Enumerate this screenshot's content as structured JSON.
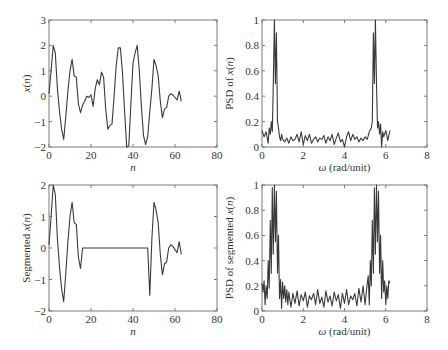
{
  "figure": {
    "background": "#ffffff",
    "line_color": "#3a3a3a",
    "frame_color": "#7a7a7a"
  },
  "chart_data": [
    {
      "id": "signal",
      "type": "line",
      "title": "",
      "xlabel": "n",
      "ylabel": "x(n)",
      "xlim": [
        0,
        80
      ],
      "ylim": [
        -2,
        3
      ],
      "xticks": [
        0,
        20,
        40,
        60,
        80
      ],
      "yticks": [
        -2,
        -1,
        0,
        1,
        2,
        3
      ],
      "grid": false,
      "box": {
        "left": 49,
        "top": 20,
        "right": 217,
        "bottom": 147
      },
      "x": [
        0,
        1,
        2,
        3,
        4,
        5,
        6,
        7,
        8,
        9,
        10,
        11,
        12,
        13,
        14,
        15,
        16,
        17,
        18,
        19,
        20,
        21,
        22,
        23,
        24,
        25,
        26,
        27,
        28,
        29,
        30,
        31,
        32,
        33,
        34,
        35,
        36,
        37,
        38,
        39,
        40,
        41,
        42,
        43,
        44,
        45,
        46,
        47,
        48,
        49,
        50,
        51,
        52,
        53,
        54,
        55,
        56,
        57,
        58,
        59,
        60,
        61,
        62,
        63
      ],
      "y": [
        0.1,
        1.0,
        2.0,
        1.7,
        0.3,
        -0.6,
        -1.3,
        -1.7,
        -0.8,
        0.2,
        1.0,
        1.45,
        0.8,
        0.75,
        -0.3,
        -0.65,
        -0.35,
        -0.2,
        0.0,
        -0.05,
        0.05,
        -0.4,
        0.3,
        0.65,
        0.45,
        0.95,
        0.75,
        -0.5,
        -1.3,
        -1.15,
        -1.1,
        0.0,
        1.2,
        1.9,
        1.9,
        0.9,
        -0.6,
        -2.0,
        -1.95,
        -0.3,
        1.3,
        1.7,
        2.0,
        1.0,
        -0.4,
        -1.55,
        -1.9,
        -1.6,
        -0.6,
        0.3,
        1.45,
        1.2,
        0.8,
        -0.2,
        -0.85,
        -0.5,
        -0.45,
        0.0,
        0.1,
        0.05,
        -0.05,
        -0.15,
        0.2,
        -0.2
      ]
    },
    {
      "id": "psd",
      "type": "line",
      "title": "",
      "xlabel": "ω (rad/unit)",
      "ylabel": "PSD of x(n)",
      "xlim": [
        0,
        8
      ],
      "ylim": [
        0,
        1
      ],
      "xticks": [
        0,
        2,
        4,
        6,
        8
      ],
      "yticks": [
        0,
        0.2,
        0.4,
        0.6,
        0.8,
        1
      ],
      "ytick_labels": [
        "0",
        "0.2",
        "0.4",
        "0.6",
        "0.8",
        "1"
      ],
      "grid": false,
      "box": {
        "left": 262,
        "top": 20,
        "right": 427,
        "bottom": 147
      },
      "x": [
        0.0,
        0.1,
        0.2,
        0.3,
        0.35,
        0.4,
        0.45,
        0.5,
        0.55,
        0.6,
        0.65,
        0.7,
        0.75,
        0.8,
        0.85,
        0.9,
        0.95,
        1.0,
        1.1,
        1.2,
        1.3,
        1.4,
        1.5,
        1.6,
        1.7,
        1.8,
        1.9,
        2.0,
        2.1,
        2.2,
        2.3,
        2.4,
        2.5,
        2.6,
        2.7,
        2.8,
        2.9,
        3.0,
        3.1,
        3.2,
        3.3,
        3.4,
        3.5,
        3.6,
        3.7,
        3.8,
        3.9,
        4.0,
        4.1,
        4.2,
        4.3,
        4.4,
        4.5,
        4.6,
        4.7,
        4.8,
        4.9,
        5.0,
        5.1,
        5.2,
        5.3,
        5.35,
        5.4,
        5.45,
        5.5,
        5.55,
        5.6,
        5.65,
        5.7,
        5.75,
        5.8,
        5.85,
        5.9,
        6.0,
        6.1,
        6.2
      ],
      "y": [
        0.13,
        0.08,
        0.12,
        0.03,
        0.15,
        0.1,
        0.2,
        0.12,
        0.5,
        1.0,
        0.5,
        0.9,
        0.2,
        0.15,
        0.08,
        0.05,
        0.1,
        0.06,
        0.04,
        0.07,
        0.03,
        0.08,
        0.05,
        0.06,
        0.1,
        0.04,
        0.12,
        0.02,
        0.09,
        0.05,
        0.1,
        0.03,
        0.06,
        0.08,
        0.04,
        0.07,
        0.06,
        0.09,
        0.03,
        0.08,
        0.05,
        0.1,
        0.02,
        0.07,
        0.11,
        0.04,
        0.06,
        0.0,
        0.08,
        0.12,
        0.05,
        0.1,
        0.06,
        0.08,
        0.04,
        0.07,
        0.05,
        0.08,
        0.06,
        0.12,
        0.15,
        0.2,
        0.9,
        0.5,
        1.0,
        0.5,
        0.15,
        0.2,
        0.1,
        0.18,
        0.0,
        0.12,
        0.08,
        0.13,
        0.05,
        0.13
      ]
    },
    {
      "id": "segmented-signal",
      "type": "line",
      "title": "",
      "xlabel": "n",
      "ylabel": "Segmented x(n)",
      "xlim": [
        0,
        80
      ],
      "ylim": [
        -2,
        2
      ],
      "xticks": [
        0,
        20,
        40,
        60,
        80
      ],
      "yticks": [
        -2,
        -1,
        0,
        1,
        2
      ],
      "grid": false,
      "box": {
        "left": 49,
        "top": 185,
        "right": 217,
        "bottom": 311
      },
      "x": [
        0,
        1,
        2,
        3,
        4,
        5,
        6,
        7,
        8,
        9,
        10,
        11,
        12,
        13,
        14,
        15,
        16,
        47,
        48,
        49,
        50,
        51,
        52,
        53,
        54,
        55,
        56,
        57,
        58,
        59,
        60,
        61,
        62,
        63
      ],
      "y": [
        0.1,
        1.0,
        2.0,
        1.7,
        0.3,
        -0.6,
        -1.3,
        -1.7,
        -0.8,
        0.2,
        1.0,
        1.45,
        0.8,
        0.75,
        -0.3,
        -0.65,
        0.0,
        0.0,
        -1.5,
        0.3,
        1.45,
        1.2,
        0.8,
        -0.2,
        -0.85,
        -0.5,
        -0.45,
        0.0,
        0.1,
        0.05,
        -0.05,
        -0.15,
        0.2,
        -0.2
      ]
    },
    {
      "id": "segmented-psd",
      "type": "line",
      "title": "",
      "xlabel": "ω (rad/unit)",
      "ylabel": "PSD of segmented x(n)",
      "xlim": [
        0,
        8
      ],
      "ylim": [
        0,
        1
      ],
      "xticks": [
        0,
        2,
        4,
        6,
        8
      ],
      "yticks": [
        0,
        0.2,
        0.4,
        0.6,
        0.8,
        1
      ],
      "ytick_labels": [
        "0",
        "0.2",
        "0.4",
        "0.6",
        "0.8",
        "1"
      ],
      "grid": false,
      "box": {
        "left": 262,
        "top": 185,
        "right": 427,
        "bottom": 311
      },
      "x": [
        0.0,
        0.05,
        0.1,
        0.15,
        0.2,
        0.25,
        0.3,
        0.35,
        0.4,
        0.45,
        0.5,
        0.55,
        0.6,
        0.65,
        0.7,
        0.75,
        0.8,
        0.85,
        0.9,
        0.95,
        1.0,
        1.05,
        1.1,
        1.15,
        1.2,
        1.25,
        1.3,
        1.4,
        1.5,
        1.6,
        1.7,
        1.8,
        1.9,
        2.0,
        2.1,
        2.2,
        2.3,
        2.4,
        2.5,
        2.6,
        2.7,
        2.8,
        2.9,
        3.0,
        3.1,
        3.2,
        3.3,
        3.4,
        3.5,
        3.6,
        3.7,
        3.8,
        3.9,
        4.0,
        4.1,
        4.2,
        4.3,
        4.4,
        4.5,
        4.6,
        4.7,
        4.8,
        4.9,
        5.0,
        5.1,
        5.15,
        5.2,
        5.25,
        5.3,
        5.35,
        5.4,
        5.45,
        5.5,
        5.55,
        5.6,
        5.65,
        5.7,
        5.75,
        5.8,
        5.85,
        5.9,
        5.95,
        6.0,
        6.05,
        6.1,
        6.15,
        6.2
      ],
      "y": [
        0.22,
        0.15,
        0.24,
        0.05,
        0.2,
        0.1,
        0.4,
        0.18,
        0.72,
        0.3,
        0.98,
        0.45,
        1.0,
        0.55,
        0.95,
        0.3,
        0.6,
        0.1,
        0.25,
        0.02,
        0.23,
        0.1,
        0.2,
        0.07,
        0.17,
        0.05,
        0.15,
        0.03,
        0.14,
        0.06,
        0.16,
        0.04,
        0.13,
        0.08,
        0.15,
        0.03,
        0.12,
        0.09,
        0.14,
        0.05,
        0.17,
        0.06,
        0.11,
        0.03,
        0.16,
        0.07,
        0.12,
        0.04,
        0.15,
        0.08,
        0.13,
        0.02,
        0.14,
        0.06,
        0.17,
        0.05,
        0.12,
        0.09,
        0.14,
        0.04,
        0.18,
        0.07,
        0.2,
        0.05,
        0.22,
        0.28,
        0.05,
        0.4,
        0.2,
        0.72,
        0.3,
        0.98,
        0.45,
        1.0,
        0.55,
        0.95,
        0.3,
        0.6,
        0.1,
        0.4,
        0.15,
        0.24,
        0.05,
        0.2,
        0.1,
        0.24,
        0.22
      ]
    }
  ]
}
